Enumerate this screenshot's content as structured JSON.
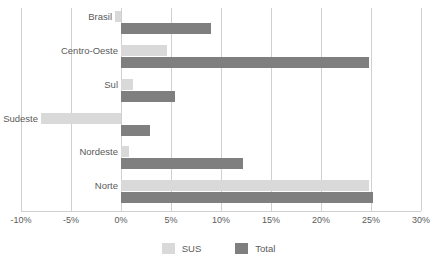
{
  "chart_data": {
    "type": "bar",
    "orientation": "horizontal",
    "title": "",
    "xlabel": "",
    "ylabel": "",
    "xlim": [
      -10,
      30
    ],
    "xtick_labels": [
      "-10%",
      "-5%",
      "0%",
      "5%",
      "10%",
      "15%",
      "20%",
      "25%",
      "30%"
    ],
    "xticks": [
      -10,
      -5,
      0,
      5,
      10,
      15,
      20,
      25,
      30
    ],
    "grid": true,
    "legend_position": "bottom",
    "categories": [
      "Brasil",
      "Centro-Oeste",
      "Sul",
      "Sudeste",
      "Nordeste",
      "Norte"
    ],
    "series": [
      {
        "name": "SUS",
        "color": "#d9d9d9",
        "values": [
          -0.6,
          4.6,
          1.2,
          -8.0,
          0.8,
          24.8
        ]
      },
      {
        "name": "Total",
        "color": "#7f7f7f",
        "values": [
          9.0,
          24.8,
          5.4,
          2.9,
          12.2,
          25.2
        ]
      }
    ]
  },
  "legend": {
    "items": [
      {
        "label": "SUS",
        "color": "#d9d9d9"
      },
      {
        "label": "Total",
        "color": "#7f7f7f"
      }
    ]
  },
  "colors": {
    "sus": "#d9d9d9",
    "total": "#7f7f7f",
    "grid": "#d0d0d0",
    "text": "#5a5a5a",
    "background": "#ffffff"
  }
}
